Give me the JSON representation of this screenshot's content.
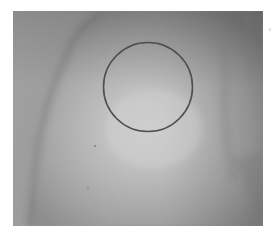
{
  "figure": {
    "type": "grayscale photograph",
    "annotation": {
      "shape": "circle",
      "center_x": 135,
      "center_y": 76,
      "radius": 44.5,
      "stroke_color": "#4f4f4f",
      "stroke_width": 1.6
    }
  },
  "colors": {
    "page_background": "#ffffff",
    "photo_background": "#9c9c9c",
    "skin_edge": "#8a8a8a",
    "skin_highlight": "#d4d4d4",
    "circle_stroke": "#4f4f4f"
  }
}
